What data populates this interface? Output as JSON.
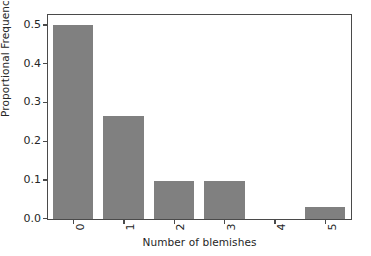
{
  "chart_data": {
    "type": "bar",
    "title": "",
    "xlabel": "Number of blemishes",
    "ylabel": "Proportional Frequency",
    "categories": [
      "0",
      "1",
      "2",
      "3",
      "4",
      "5"
    ],
    "values": [
      0.5,
      0.265,
      0.098,
      0.098,
      0.0,
      0.03
    ],
    "series": [
      {
        "name": "Proportional Frequency",
        "values": [
          0.5,
          0.265,
          0.098,
          0.098,
          0.0,
          0.03
        ]
      }
    ],
    "xlim": [
      -0.5,
      5.5
    ],
    "ylim": [
      0.0,
      0.525
    ],
    "ytick_labels": [
      "0.0",
      "0.1",
      "0.2",
      "0.3",
      "0.4",
      "0.5"
    ],
    "ytick_values": [
      0.0,
      0.1,
      0.2,
      0.3,
      0.4,
      0.5
    ],
    "xtick_labels": [
      "0",
      "1",
      "2",
      "3",
      "4",
      "5"
    ],
    "xtick_label_rotation": 90,
    "grid": false,
    "legend": false,
    "legend_position": "none",
    "bar_color": "#808080",
    "bar_width_fraction": 0.8,
    "axes_edge_color": "#4a4a4a",
    "background_color": "#ffffff",
    "text_color": "#262626"
  }
}
